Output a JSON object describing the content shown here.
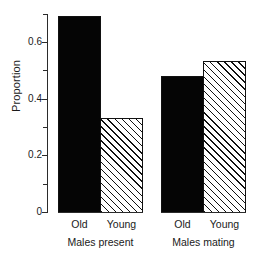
{
  "chart_data": {
    "type": "bar",
    "title": "",
    "subtitle": "",
    "xlabel": "",
    "ylabel": "Proportion",
    "ylim": [
      0,
      0.7
    ],
    "grid": false,
    "legend": "none",
    "y_ticks_major": [
      "0",
      "0.2",
      "0.4",
      "0.6"
    ],
    "y_tick_values_major": [
      0,
      0.2,
      0.4,
      0.6
    ],
    "y_tick_values_minor": [
      0.1,
      0.3,
      0.5,
      0.7
    ],
    "categories": [
      "Old",
      "Young"
    ],
    "groups": [
      {
        "name": "Males present",
        "bars": [
          {
            "label": "Old",
            "value": 0.69,
            "fill": "solid"
          },
          {
            "label": "Young",
            "value": 0.33,
            "fill": "hatched"
          }
        ]
      },
      {
        "name": "Males mating",
        "bars": [
          {
            "label": "Old",
            "value": 0.48,
            "fill": "solid"
          },
          {
            "label": "Young",
            "value": 0.53,
            "fill": "hatched"
          }
        ]
      }
    ],
    "series": [
      {
        "name": "Old",
        "values": [
          0.69,
          0.48
        ]
      },
      {
        "name": "Young",
        "values": [
          0.33,
          0.53
        ]
      }
    ],
    "colors": {
      "solid_fill": "#050505",
      "hatch_line": "#111111",
      "hatch_background": "#ffffff",
      "axis": "#2b2b2b",
      "text": "#1a1a1a",
      "background": "#ffffff"
    }
  },
  "geometry": {
    "baseline_y": 212,
    "px_per_unit": 284,
    "axis_top_y": 14,
    "bars_px": [
      {
        "x": 58,
        "w": 43
      },
      {
        "x": 100,
        "w": 43
      },
      {
        "x": 161,
        "w": 43
      },
      {
        "x": 203,
        "w": 43
      }
    ],
    "group_axis_px": [
      {
        "x": 58,
        "w": 85
      },
      {
        "x": 161,
        "w": 85
      }
    ]
  }
}
